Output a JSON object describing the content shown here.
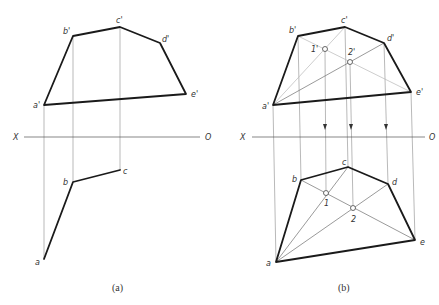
{
  "figure_a": {
    "caption": "(a)",
    "axis": {
      "left_label": "X",
      "right_label": "O"
    },
    "labels": {
      "a_prime": "a'",
      "b_prime": "b'",
      "c_prime": "c'",
      "d_prime": "d'",
      "e_prime": "e'",
      "a": "a",
      "b": "b",
      "c": "c"
    }
  },
  "figure_b": {
    "caption": "(b)",
    "axis": {
      "left_label": "X",
      "right_label": "O"
    },
    "labels": {
      "a_prime": "a'",
      "b_prime": "b'",
      "c_prime": "c'",
      "d_prime": "d'",
      "e_prime": "e'",
      "p1_prime": "1'",
      "p2_prime": "2'",
      "a": "a",
      "b": "b",
      "c": "c",
      "d": "d",
      "e": "e",
      "p1": "1",
      "p2": "2"
    }
  },
  "colors": {
    "outline": "#1a1a1a",
    "projection": "#8a8a8a",
    "auxiliary": "#b8b8b8"
  }
}
